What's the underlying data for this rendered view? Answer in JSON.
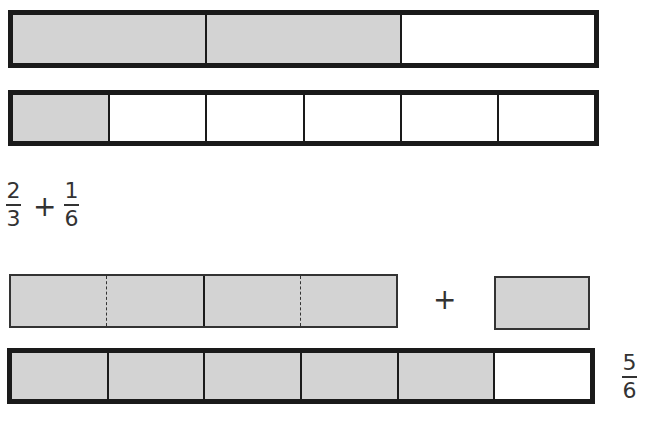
{
  "diagram": {
    "bar_thirds": {
      "parts": 3,
      "shaded": 2,
      "label": "2/3"
    },
    "bar_sixths": {
      "parts": 6,
      "shaded": 1,
      "label": "1/6"
    },
    "expression": {
      "term1": {
        "numerator": "2",
        "denominator": "3"
      },
      "operator": "+",
      "term2": {
        "numerator": "1",
        "denominator": "6"
      }
    },
    "regrouped": {
      "parts": 4,
      "shaded": 4,
      "operator": "+",
      "single_part_shaded": true
    },
    "result_bar": {
      "parts": 6,
      "shaded": 5
    },
    "result": {
      "numerator": "5",
      "denominator": "6"
    },
    "colors": {
      "shaded": "#d3d3d3",
      "border": "#1a1a1a",
      "background": "#ffffff"
    }
  }
}
